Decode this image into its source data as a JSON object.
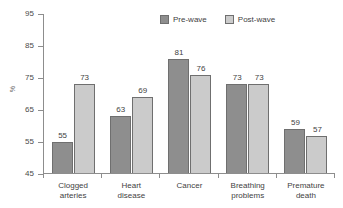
{
  "chart_data": {
    "type": "bar",
    "title": "",
    "subtitle": "",
    "xlabel": "",
    "ylabel": "%",
    "categories": [
      "Clogged arteries",
      "Heart disease",
      "Cancer",
      "Breathing problems",
      "Premature death"
    ],
    "category_lines": [
      [
        "Clogged",
        "arteries"
      ],
      [
        "Heart",
        "disease"
      ],
      [
        "Cancer",
        ""
      ],
      [
        "Breathing",
        "problems"
      ],
      [
        "Premature",
        "death"
      ]
    ],
    "series": [
      {
        "name": "Pre-wave",
        "color": "#8e8e8e",
        "values": [
          55,
          63,
          81,
          73,
          59
        ]
      },
      {
        "name": "Post-wave",
        "color": "#cbcbcb",
        "values": [
          73,
          69,
          76,
          73,
          57
        ]
      }
    ],
    "ylim": [
      45,
      95
    ],
    "yticks": [
      45,
      55,
      65,
      75,
      85,
      95
    ],
    "ytick_labels": [
      "45",
      "55",
      "65",
      "75",
      "85",
      "95"
    ],
    "grid": false,
    "legend_position": "top-right-inside",
    "value_labels": true,
    "axis_color": "#8d8d8d",
    "bar_border_color": "#6f6f6f",
    "background": "#ffffff"
  }
}
